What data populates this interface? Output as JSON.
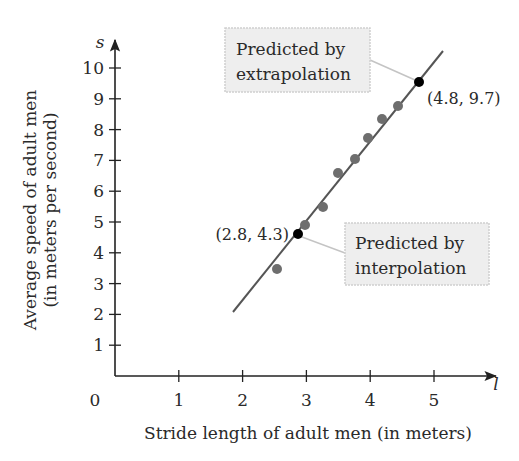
{
  "chart_data": {
    "type": "scatter",
    "title": "",
    "xlabel": "Stride length of adult men (in meters)",
    "ylabel_lines": [
      "Average speed of adult men",
      "(in meters per second)"
    ],
    "x_var": "l",
    "y_var": "s",
    "origin_label": "0",
    "xlim": [
      0,
      5.5
    ],
    "ylim": [
      0,
      10.5
    ],
    "x_ticks": [
      1,
      2,
      3,
      4,
      5
    ],
    "y_ticks": [
      1,
      2,
      3,
      4,
      5,
      6,
      7,
      8,
      9,
      10
    ],
    "grid": false,
    "legend": null,
    "series": [
      {
        "name": "Observed data",
        "color": "#6b6b6b",
        "points": [
          {
            "x": 2.5,
            "y": 3.5
          },
          {
            "x": 2.95,
            "y": 4.9
          },
          {
            "x": 3.25,
            "y": 5.5
          },
          {
            "x": 3.5,
            "y": 6.6
          },
          {
            "x": 3.75,
            "y": 7.05
          },
          {
            "x": 3.95,
            "y": 7.75
          },
          {
            "x": 4.15,
            "y": 8.35
          },
          {
            "x": 4.4,
            "y": 8.8
          }
        ]
      }
    ],
    "fit_line": {
      "x_start": 1.85,
      "y_start": 2.05,
      "x_end": 5.1,
      "y_end": 10.5,
      "color": "#555555"
    },
    "highlighted_points": [
      {
        "x": 2.8,
        "y": 4.3,
        "label": "(2.8, 4.3)",
        "annotation": "Predicted by interpolation",
        "color": "#000000"
      },
      {
        "x": 4.8,
        "y": 9.7,
        "label": "(4.8, 9.7)",
        "annotation": "Predicted by extrapolation",
        "color": "#000000"
      }
    ]
  },
  "labels": {
    "y_var": "s",
    "x_var": "l",
    "origin": "0",
    "x_title": "Stride length of adult men (in meters)",
    "y_title_line1": "Average speed of adult men",
    "y_title_line2": "(in meters per second)",
    "extrap_line1": "Predicted by",
    "extrap_line2": "extrapolation",
    "interp_line1": "Predicted by",
    "interp_line2": "interpolation",
    "extrap_coord": "(4.8, 9.7)",
    "interp_coord": "(2.8, 4.3)"
  },
  "pixels": {
    "observed": [
      [
        277,
        269
      ],
      [
        305,
        225
      ],
      [
        323,
        207
      ],
      [
        338,
        173
      ],
      [
        355,
        159
      ],
      [
        368,
        138
      ],
      [
        382,
        119
      ],
      [
        398,
        106
      ]
    ],
    "interp_point": [
      298,
      234
    ],
    "extrap_point": [
      419,
      82
    ],
    "line": [
      233,
      312,
      443,
      51
    ]
  },
  "colors": {
    "axis": "#222222",
    "observed": "#6e6e6e",
    "fit_line": "#555555",
    "highlight": "#000000",
    "callout_fill": "#eeeeee",
    "callout_border": "#cfcfcf",
    "connector": "#c4c4c4"
  }
}
